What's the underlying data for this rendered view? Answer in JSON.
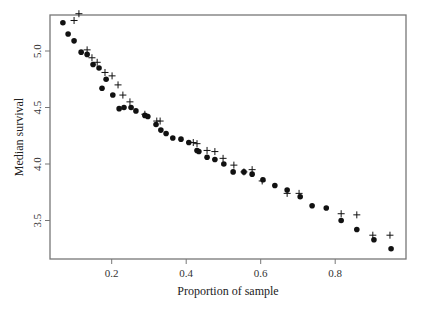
{
  "chart_data": {
    "type": "scatter",
    "title": "",
    "xlabel": "Proportion of sample",
    "ylabel": "Median survival",
    "xlim": [
      0.035,
      0.995
    ],
    "ylim": [
      3.18,
      5.33
    ],
    "xticks": [
      0.2,
      0.4,
      0.6,
      0.8
    ],
    "xtick_labels": [
      "0.2",
      "0.4",
      "0.6",
      "0.8"
    ],
    "yticks": [
      3.5,
      4.0,
      4.5,
      5.0
    ],
    "ytick_labels": [
      "3.5",
      "4.0",
      "4.5",
      "5.0"
    ],
    "grid": false,
    "legend": null,
    "series": [
      {
        "name": "dots",
        "marker": "filled-circle",
        "color": "#111111",
        "x": [
          0.069,
          0.083,
          0.099,
          0.118,
          0.134,
          0.15,
          0.166,
          0.174,
          0.185,
          0.203,
          0.22,
          0.233,
          0.252,
          0.265,
          0.289,
          0.297,
          0.319,
          0.332,
          0.346,
          0.364,
          0.386,
          0.407,
          0.429,
          0.434,
          0.456,
          0.477,
          0.501,
          0.526,
          0.555,
          0.577,
          0.606,
          0.638,
          0.671,
          0.706,
          0.738,
          0.776,
          0.816,
          0.858,
          0.904,
          0.95
        ],
        "y": [
          5.25,
          5.15,
          5.09,
          4.99,
          4.97,
          4.88,
          4.85,
          4.67,
          4.75,
          4.61,
          4.49,
          4.5,
          4.5,
          4.47,
          4.43,
          4.42,
          4.35,
          4.3,
          4.27,
          4.23,
          4.22,
          4.19,
          4.12,
          4.11,
          4.06,
          4.04,
          4.0,
          3.93,
          3.93,
          3.91,
          3.86,
          3.81,
          3.77,
          3.71,
          3.63,
          3.61,
          3.5,
          3.42,
          3.33,
          3.25
        ]
      },
      {
        "name": "crosses",
        "marker": "plus",
        "color": "#111111",
        "x": [
          0.099,
          0.112,
          0.134,
          0.147,
          0.161,
          0.182,
          0.201,
          0.217,
          0.23,
          0.249,
          0.289,
          0.321,
          0.33,
          0.419,
          0.429,
          0.456,
          0.477,
          0.499,
          0.528,
          0.555,
          0.577,
          0.604,
          0.671,
          0.703,
          0.816,
          0.858,
          0.901,
          0.947
        ],
        "y": [
          5.27,
          5.33,
          5.01,
          4.94,
          4.9,
          4.81,
          4.78,
          4.7,
          4.61,
          4.55,
          4.44,
          4.38,
          4.38,
          4.19,
          4.18,
          4.12,
          4.11,
          4.05,
          3.99,
          3.93,
          3.95,
          3.85,
          3.74,
          3.74,
          3.56,
          3.55,
          3.37,
          3.37
        ]
      }
    ]
  }
}
